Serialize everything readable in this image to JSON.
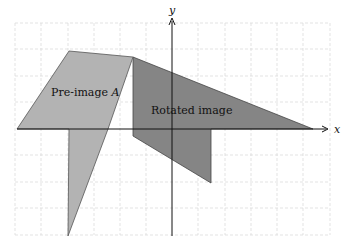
{
  "diagram": {
    "axes": {
      "x_label": "x",
      "y_label": "y",
      "grid": true,
      "grid_style": "dashed",
      "grid_color": "#d9d9d9",
      "axis_color": "#111111"
    },
    "shapes": [
      {
        "name": "Pre-image A",
        "label": "Pre-image ",
        "label_italic": "A",
        "fill": "#b3b3b3",
        "stroke": "#555555"
      },
      {
        "name": "Rotated image",
        "label": "Rotated image",
        "fill": "#858585",
        "stroke": "#444444"
      }
    ]
  }
}
